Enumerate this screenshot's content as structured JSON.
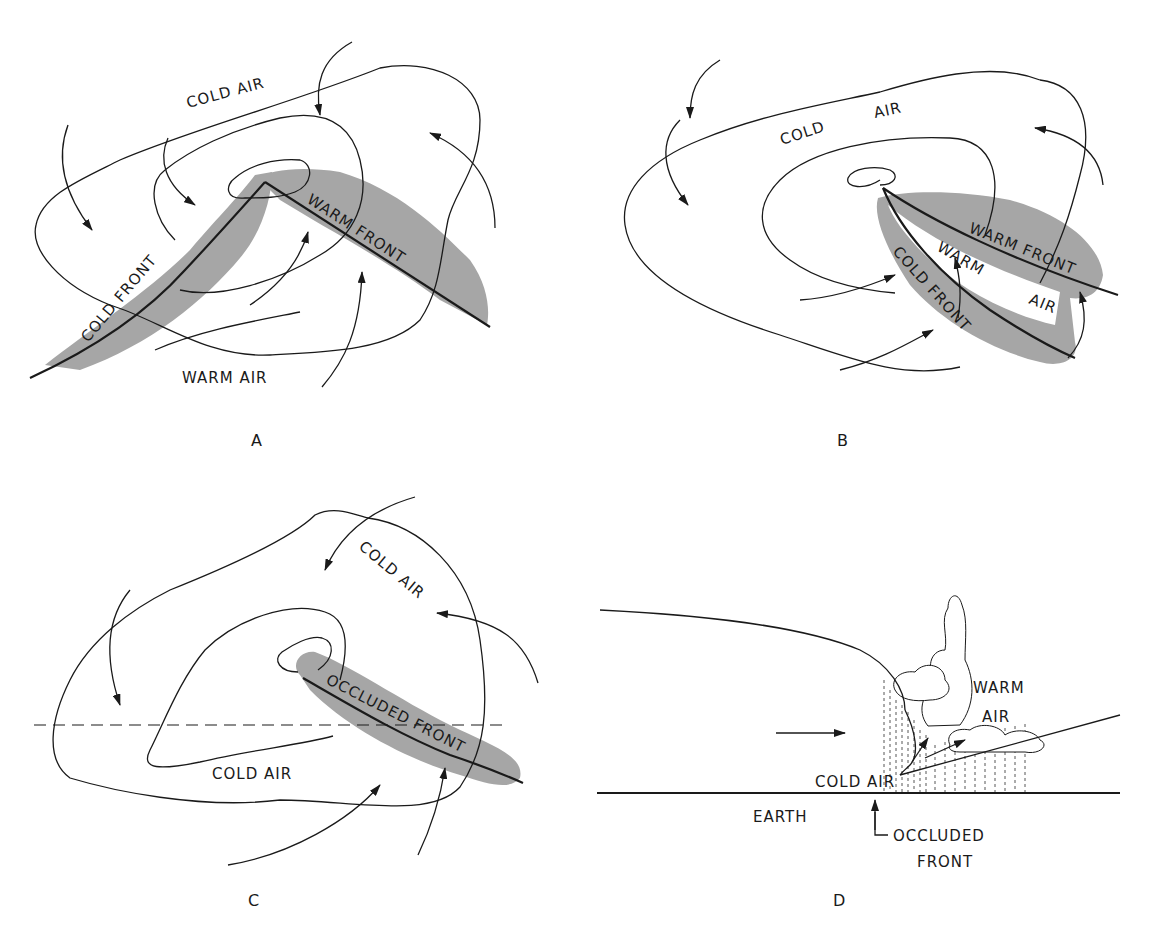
{
  "figure": {
    "colors": {
      "ink": "#1a1a1a",
      "frontal_zone_shading": "#a6a6a6",
      "background": "#ffffff"
    }
  },
  "panels": {
    "a": {
      "label": "A",
      "labels": {
        "cold_air": "COLD  AIR",
        "cold_front": "COLD FRONT",
        "warm_front": "WARM FRONT",
        "warm_air": "WARM  AIR"
      }
    },
    "b": {
      "label": "B",
      "labels": {
        "cold": "COLD",
        "air": "AIR",
        "warm_front": "WARM  FRONT",
        "warm": "WARM",
        "warm_air_air": "AIR",
        "cold_front": "COLD  FRONT"
      }
    },
    "c": {
      "label": "C",
      "labels": {
        "cold_air_top": "COLD  AIR",
        "occluded_front": "OCCLUDED  FRONT",
        "cold_air_bottom": "COLD AIR"
      }
    },
    "d": {
      "label": "D",
      "labels": {
        "warm": "WARM",
        "air": "AIR",
        "cold_air": "COLD  AIR",
        "earth": "EARTH",
        "occluded": "OCCLUDED",
        "front": "FRONT"
      }
    }
  }
}
